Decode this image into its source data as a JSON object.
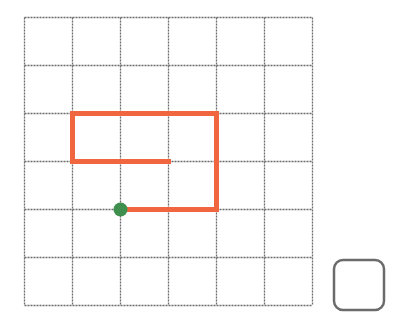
{
  "grid": {
    "rows": 6,
    "cols": 6,
    "origin_x": 24,
    "origin_y": 17,
    "cell_size": 48,
    "line_color": "#6b6b6b",
    "line_style": "dashed"
  },
  "path": {
    "color": "#f0673f",
    "stroke_width": 5,
    "points_grid": [
      [
        2,
        4
      ],
      [
        4,
        4
      ],
      [
        4,
        2
      ],
      [
        1,
        2
      ],
      [
        1,
        3
      ],
      [
        3,
        3
      ]
    ]
  },
  "start_marker": {
    "color": "#3f8f4f",
    "grid_point": [
      2,
      4
    ]
  },
  "answer_box": {
    "x": 334,
    "y": 260,
    "size": 50,
    "radius": 9,
    "border_color": "#6b6b6b",
    "content": ""
  }
}
